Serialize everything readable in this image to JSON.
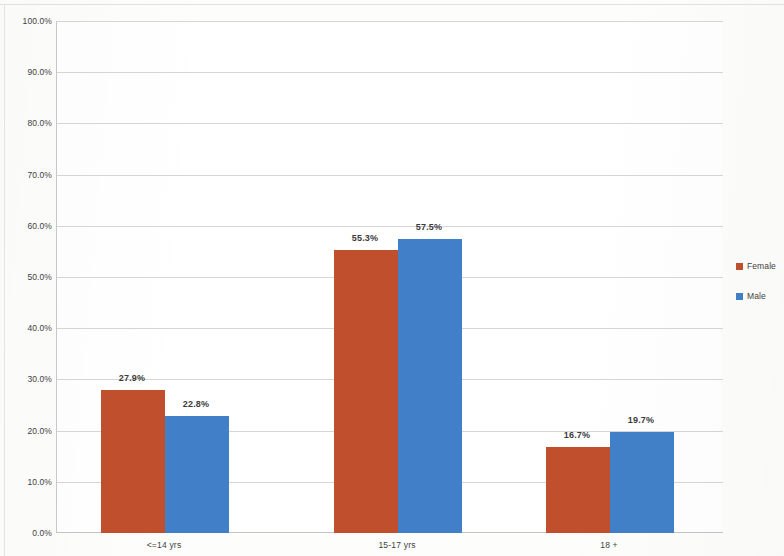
{
  "chart_data": {
    "type": "bar",
    "title": "",
    "subtitle": "",
    "xlabel": "",
    "ylabel": "",
    "categories": [
      "<=14 yrs",
      "15-17 yrs",
      "18 +"
    ],
    "series": [
      {
        "name": "Female",
        "color": "#C0502D",
        "values": [
          27.9,
          55.3,
          16.7
        ],
        "labels": [
          "27.9%",
          "55.3%",
          "16.7%"
        ]
      },
      {
        "name": "Male",
        "color": "#4180C8",
        "values": [
          22.8,
          57.5,
          19.7
        ],
        "labels": [
          "22.8%",
          "57.5%",
          "19.7%"
        ]
      }
    ],
    "ylim": [
      0,
      100
    ],
    "ytick_values": [
      0,
      10,
      20,
      30,
      40,
      50,
      60,
      70,
      80,
      90,
      100
    ],
    "ytick_labels": [
      "0.0%",
      "10.0%",
      "20.0%",
      "30.0%",
      "40.0%",
      "50.0%",
      "60.0%",
      "70.0%",
      "80.0%",
      "90.0%",
      "100.0%"
    ],
    "grid": "horizontal",
    "legend_position": "right",
    "value_labels_shown": true
  },
  "axis": {
    "y": {
      "ticks": [
        {
          "label": "100.0%",
          "value": 100
        },
        {
          "label": "90.0%",
          "value": 90
        },
        {
          "label": "80.0%",
          "value": 80
        },
        {
          "label": "70.0%",
          "value": 70
        },
        {
          "label": "60.0%",
          "value": 60
        },
        {
          "label": "50.0%",
          "value": 50
        },
        {
          "label": "40.0%",
          "value": 40
        },
        {
          "label": "30.0%",
          "value": 30
        },
        {
          "label": "20.0%",
          "value": 20
        },
        {
          "label": "10.0%",
          "value": 10
        },
        {
          "label": "0.0%",
          "value": 0
        }
      ]
    },
    "x": {
      "ticks": [
        {
          "label": "<=14 yrs"
        },
        {
          "label": "15-17 yrs"
        },
        {
          "label": "18 +"
        }
      ]
    }
  },
  "legend": {
    "items": [
      {
        "label": "Female",
        "color": "#C0502D"
      },
      {
        "label": "Male",
        "color": "#4180C8"
      }
    ]
  },
  "colors": {
    "female": "#C0502D",
    "male": "#4180C8",
    "gridline": "#D6D6D6",
    "axis": "#C4C4C4",
    "text": "#3F3F3F",
    "plot_background": "#FFFFFF",
    "page_background": "#FDFDFC"
  }
}
